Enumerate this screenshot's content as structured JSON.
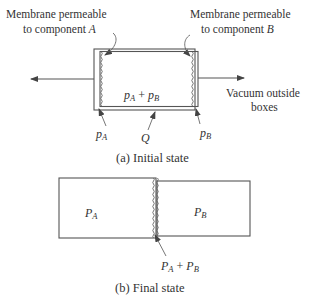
{
  "figure": {
    "part_a": {
      "caption": "(a) Initial state",
      "label_membrane_a": {
        "line1": "Membrane permeable",
        "line2": "to component ",
        "component": "A"
      },
      "label_membrane_b": {
        "line1": "Membrane permeable",
        "line2": "to component ",
        "component": "B"
      },
      "label_vacuum": {
        "line1": "Vacuum outside",
        "line2": "boxes"
      },
      "center_expr": {
        "p1": "p",
        "s1": "A",
        "op": " + ",
        "p2": "p",
        "s2": "B"
      },
      "label_pa": {
        "p": "p",
        "s": "A"
      },
      "label_pb": {
        "p": "p",
        "s": "B"
      },
      "label_q": "Q"
    },
    "part_b": {
      "caption": "(b) Final state",
      "box_a_label": {
        "p": "P",
        "s": "A"
      },
      "box_b_label": {
        "p": "P",
        "s": "B"
      },
      "membrane_label": {
        "p1": "P",
        "s1": "A",
        "op": " + ",
        "p2": "P",
        "s2": "B"
      }
    }
  }
}
